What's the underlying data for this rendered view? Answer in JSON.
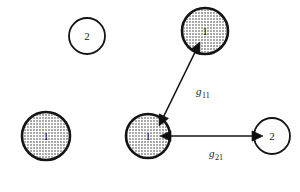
{
  "figure": {
    "background_color": "#ffffff",
    "ink_color": "#141414",
    "width": 300,
    "height": 192
  },
  "nodes": [
    {
      "id": "node-top-left",
      "label": "2",
      "fill_style": "hollow",
      "cx": 87,
      "cy": 36,
      "r": 18,
      "stroke_width": 1.8
    },
    {
      "id": "node-top-right",
      "label": "1",
      "fill_style": "stippled",
      "cx": 205,
      "cy": 31,
      "r": 23,
      "stroke_width": 2.6
    },
    {
      "id": "node-bottom-left",
      "label": "1",
      "fill_style": "stippled",
      "cx": 46,
      "cy": 136,
      "r": 24,
      "stroke_width": 2.6
    },
    {
      "id": "node-center",
      "label": "1",
      "fill_style": "stippled",
      "cx": 148,
      "cy": 136,
      "r": 22,
      "stroke_width": 2.6
    },
    {
      "id": "node-right",
      "label": "2",
      "fill_style": "hollow",
      "cx": 272,
      "cy": 136,
      "r": 18,
      "stroke_width": 1.8
    }
  ],
  "edges": [
    {
      "id": "edge-g11",
      "label": "g",
      "subscript": "11",
      "from": "node-center",
      "to": "node-top-right",
      "x1": 159,
      "y1": 126,
      "x2": 200,
      "y2": 42,
      "arrow_start": true,
      "arrow_end": true,
      "stroke_width": 1.6,
      "label_x": 196,
      "label_y": 95
    },
    {
      "id": "edge-g21",
      "label": "g",
      "subscript": "21",
      "from": "node-center",
      "to": "node-right",
      "x1": 160,
      "y1": 136,
      "x2": 263,
      "y2": 136,
      "arrow_start": true,
      "arrow_end": true,
      "stroke_width": 1.6,
      "label_x": 209,
      "label_y": 157
    }
  ]
}
